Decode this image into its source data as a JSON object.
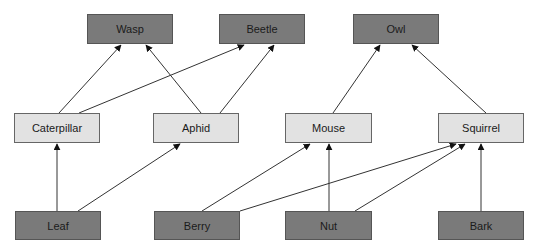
{
  "colors": {
    "dark_fill": "#7a7a7a",
    "light_fill": "#e2e2e2",
    "edge": "#333333"
  },
  "nodes": [
    {
      "id": "wasp",
      "label": "Wasp",
      "tier": "predator",
      "x": 87,
      "y": 14,
      "w": 86,
      "h": 30
    },
    {
      "id": "beetle",
      "label": "Beetle",
      "tier": "predator",
      "x": 219,
      "y": 14,
      "w": 86,
      "h": 30
    },
    {
      "id": "owl",
      "label": "Owl",
      "tier": "predator",
      "x": 353,
      "y": 14,
      "w": 86,
      "h": 30
    },
    {
      "id": "caterpillar",
      "label": "Caterpillar",
      "tier": "consumer",
      "x": 14,
      "y": 113,
      "w": 86,
      "h": 30
    },
    {
      "id": "aphid",
      "label": "Aphid",
      "tier": "consumer",
      "x": 153,
      "y": 113,
      "w": 86,
      "h": 30
    },
    {
      "id": "mouse",
      "label": "Mouse",
      "tier": "consumer",
      "x": 285,
      "y": 113,
      "w": 87,
      "h": 30
    },
    {
      "id": "squirrel",
      "label": "Squirrel",
      "tier": "consumer",
      "x": 438,
      "y": 113,
      "w": 86,
      "h": 30
    },
    {
      "id": "leaf",
      "label": "Leaf",
      "tier": "producer",
      "x": 15,
      "y": 211,
      "w": 86,
      "h": 29
    },
    {
      "id": "berry",
      "label": "Berry",
      "tier": "producer",
      "x": 154,
      "y": 211,
      "w": 86,
      "h": 29
    },
    {
      "id": "nut",
      "label": "Nut",
      "tier": "producer",
      "x": 285,
      "y": 211,
      "w": 87,
      "h": 29
    },
    {
      "id": "bark",
      "label": "Bark",
      "tier": "producer",
      "x": 438,
      "y": 211,
      "w": 86,
      "h": 29
    }
  ],
  "edges": [
    {
      "from": "caterpillar",
      "to": "wasp",
      "x1": 59,
      "y1": 113,
      "x2": 121,
      "y2": 45
    },
    {
      "from": "aphid",
      "to": "wasp",
      "x1": 201,
      "y1": 113,
      "x2": 146,
      "y2": 45
    },
    {
      "from": "caterpillar",
      "to": "beetle",
      "x1": 79,
      "y1": 113,
      "x2": 244,
      "y2": 45
    },
    {
      "from": "aphid",
      "to": "beetle",
      "x1": 220,
      "y1": 113,
      "x2": 274,
      "y2": 45
    },
    {
      "from": "mouse",
      "to": "owl",
      "x1": 333,
      "y1": 113,
      "x2": 380,
      "y2": 45
    },
    {
      "from": "squirrel",
      "to": "owl",
      "x1": 486,
      "y1": 113,
      "x2": 412,
      "y2": 45
    },
    {
      "from": "leaf",
      "to": "caterpillar",
      "x1": 57,
      "y1": 211,
      "x2": 57,
      "y2": 144
    },
    {
      "from": "leaf",
      "to": "aphid",
      "x1": 78,
      "y1": 211,
      "x2": 180,
      "y2": 144
    },
    {
      "from": "berry",
      "to": "mouse",
      "x1": 202,
      "y1": 211,
      "x2": 310,
      "y2": 144
    },
    {
      "from": "berry",
      "to": "squirrel",
      "x1": 240,
      "y1": 211,
      "x2": 456,
      "y2": 144
    },
    {
      "from": "nut",
      "to": "mouse",
      "x1": 329,
      "y1": 211,
      "x2": 329,
      "y2": 144
    },
    {
      "from": "nut",
      "to": "squirrel",
      "x1": 355,
      "y1": 211,
      "x2": 465,
      "y2": 144
    },
    {
      "from": "bark",
      "to": "squirrel",
      "x1": 481,
      "y1": 211,
      "x2": 481,
      "y2": 144
    }
  ]
}
